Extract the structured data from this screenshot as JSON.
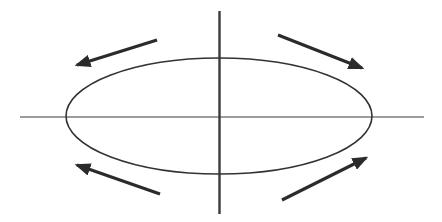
{
  "diagram": {
    "colors": {
      "background": "#ffffff",
      "axis": "#3a3a3a",
      "ellipse": "#333333",
      "arrow": "#2b2b2b"
    },
    "axes": {
      "horizontal": {
        "x1": 20,
        "y1": 117,
        "x2": 424,
        "y2": 117,
        "width": 1.2
      },
      "vertical": {
        "x1": 219.5,
        "y1": 11,
        "x2": 219.5,
        "y2": 214,
        "width": 2.4
      }
    },
    "ellipse": {
      "cx": 219,
      "cy": 116,
      "rx": 153,
      "ry": 58,
      "width": 1.6
    },
    "arrows": [
      {
        "name": "arrow-top-left",
        "direction": "left-down",
        "x1": 157,
        "y1": 40,
        "x2": 77,
        "y2": 65
      },
      {
        "name": "arrow-top-right",
        "direction": "right-down",
        "x1": 278,
        "y1": 35,
        "x2": 362,
        "y2": 68
      },
      {
        "name": "arrow-bottom-left",
        "direction": "left-up",
        "x1": 160,
        "y1": 194,
        "x2": 77,
        "y2": 165
      },
      {
        "name": "arrow-bottom-right",
        "direction": "right-up",
        "x1": 282,
        "y1": 200,
        "x2": 366,
        "y2": 158
      }
    ]
  }
}
